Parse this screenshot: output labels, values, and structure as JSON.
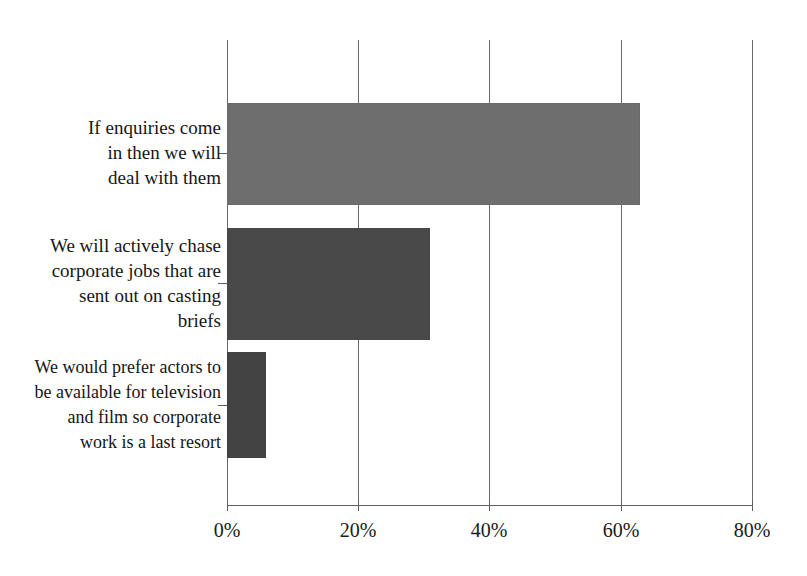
{
  "chart_data": {
    "type": "bar",
    "orientation": "horizontal",
    "title": "",
    "clipped_header_text": "",
    "xlabel": "",
    "ylabel": "",
    "xlim": [
      0,
      80
    ],
    "x_tick_labels": [
      "0%",
      "20%",
      "40%",
      "60%",
      "80%"
    ],
    "x_ticks": [
      0,
      20,
      40,
      60,
      80
    ],
    "grid": true,
    "legend": "none",
    "categories": [
      "If enquiries come in then we will deal with them",
      "We will actively chase corporate jobs that are sent out on casting briefs",
      "We would prefer actors to be available for television and film so corporate work is a last resort"
    ],
    "values": [
      63,
      31,
      6
    ],
    "bar_colors": [
      "#6e6e6e",
      "#494949",
      "#434343"
    ]
  },
  "axis": {
    "x_ticks": [
      {
        "label": "0%",
        "value": 0
      },
      {
        "label": "20%",
        "value": 20
      },
      {
        "label": "40%",
        "value": 40
      },
      {
        "label": "60%",
        "value": 60
      },
      {
        "label": "80%",
        "value": 80
      }
    ]
  },
  "categories": [
    {
      "id": "enquiries-reactive",
      "lines": [
        "If enquiries come",
        "in then we will",
        "deal with them"
      ],
      "value": 63,
      "color": "#6e6e6e"
    },
    {
      "id": "actively-chase-casting-briefs",
      "lines": [
        "We will actively chase",
        "corporate jobs that are",
        "sent out on casting",
        "briefs"
      ],
      "value": 31,
      "color": "#494949"
    },
    {
      "id": "prefer-tv-film-corporate-last-resort",
      "lines": [
        "We would prefer actors to",
        "be available for television",
        "and film so corporate",
        "work is a last resort"
      ],
      "value": 6,
      "color": "#434343"
    }
  ]
}
